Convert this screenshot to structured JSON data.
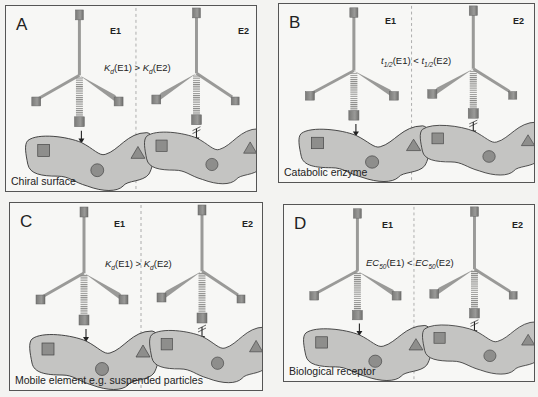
{
  "figure": {
    "panels": [
      {
        "letter": "A",
        "enantiomer_left": "E1",
        "enantiomer_right": "E2",
        "relation": {
          "sym": "K",
          "sub": "d",
          "left_arg": "(E1)",
          "op": " > ",
          "sym2": "K",
          "sub2": "d",
          "right_arg": "(E2)"
        },
        "caption": "Chiral surface"
      },
      {
        "letter": "B",
        "enantiomer_left": "E1",
        "enantiomer_right": "E2",
        "relation": {
          "sym": "t",
          "sub": "1/2",
          "left_arg": "(E1)",
          "op": " < ",
          "sym2": "t",
          "sub2": "1/2",
          "right_arg": "(E2)"
        },
        "caption": "Catabolic enzyme"
      },
      {
        "letter": "C",
        "enantiomer_left": "E1",
        "enantiomer_right": "E2",
        "relation": {
          "sym": "K",
          "sub": "d",
          "left_arg": "(E1)",
          "op": " > ",
          "sym2": "K",
          "sub2": "d",
          "right_arg": "(E2)"
        },
        "caption": "Mobile element e.g. suspended particles"
      },
      {
        "letter": "D",
        "enantiomer_left": "E1",
        "enantiomer_right": "E2",
        "relation": {
          "sym": "EC",
          "sub": "50",
          "left_arg": "(E1)",
          "op": " < ",
          "sym2": "EC",
          "sub2": "50",
          "right_arg": "(E2)"
        },
        "caption": "Biological receptor"
      }
    ],
    "legend_symbols": [
      "square-site",
      "circle-site",
      "triangle-site"
    ],
    "colors": {
      "background": "#f3f3f1",
      "panel_border": "#555555",
      "blob_fill": "#c4c4c2",
      "site_fill": "#8e8e8c",
      "bond_color": "#9a9a98",
      "arrow_color": "#222222"
    }
  }
}
